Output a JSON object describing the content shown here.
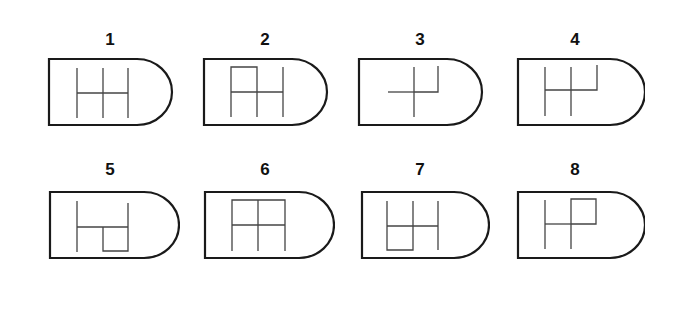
{
  "colors": {
    "stroke": "#1a1a1a",
    "inner_stroke": "#444444",
    "background": "#ffffff"
  },
  "items": [
    {
      "label": "1",
      "pattern": "three vertical gates joined by horizontal bar (H with extra gate)"
    },
    {
      "label": "2",
      "pattern": "H pattern with top-left box closed"
    },
    {
      "label": "3",
      "pattern": "cross with right gate going up"
    },
    {
      "label": "4",
      "pattern": "three gates up, horizontal bar, right gate only upward"
    },
    {
      "label": "5",
      "pattern": "left gate, horizontal bar, bottom-right box"
    },
    {
      "label": "6",
      "pattern": "grid with top bar closed"
    },
    {
      "label": "7",
      "pattern": "H pattern with bottom-left box closed"
    },
    {
      "label": "8",
      "pattern": "left gate, cross with top-right box"
    }
  ]
}
